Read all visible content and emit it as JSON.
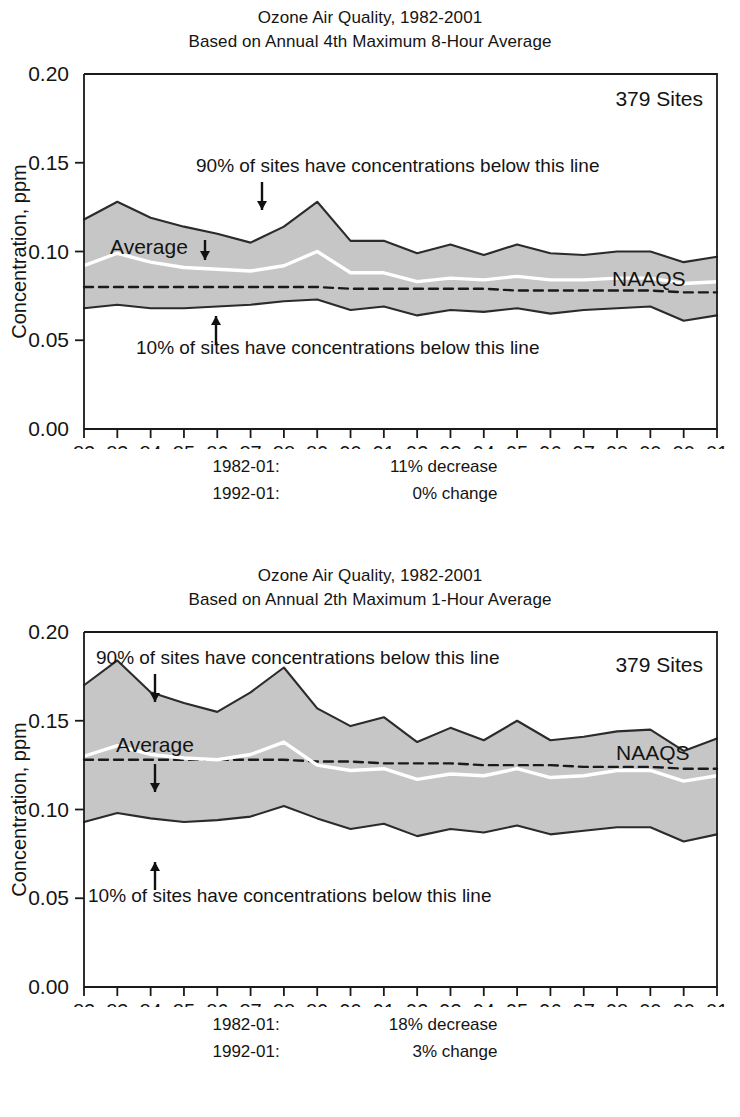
{
  "page": {
    "background": "#ffffff",
    "band_fill": "#c6c6c6",
    "band_edge": "#2b2b2b",
    "average_line_color": "#ffffff",
    "naaqs_line_color": "#1a1a1a"
  },
  "charts": [
    {
      "id": "ozone-8hour",
      "title_line1": "Ozone Air Quality, 1982-2001",
      "title_line2": "Based on Annual 4th Maximum 8-Hour Average",
      "sites_label": "379 Sites",
      "naaqs_label": "NAAQS",
      "average_label": "Average",
      "upper_annotation": "90% of sites have concentrations below this line",
      "lower_annotation": "10% of sites have concentrations below this line",
      "ylabel": "Concentration, ppm",
      "ytick_labels": [
        "0.20",
        "0.15",
        "0.10",
        "0.05",
        "0.00"
      ],
      "ytick_values": [
        0.2,
        0.15,
        0.1,
        0.05,
        0.0
      ],
      "ylim": [
        0.0,
        0.2
      ],
      "xtick_labels": [
        "82",
        "83",
        "84",
        "85",
        "86",
        "87",
        "88",
        "89",
        "90",
        "91",
        "92",
        "93",
        "94",
        "95",
        "96",
        "97",
        "98",
        "00",
        "00",
        "01"
      ],
      "footnotes": [
        {
          "label": "1982-01:",
          "value": "11% decrease"
        },
        {
          "label": "1992-01:",
          "value": "0% change"
        }
      ],
      "chart_data": {
        "type": "area",
        "title": "Ozone Air Quality, 1982-2001 — Based on Annual 4th Maximum 8-Hour Average",
        "xlabel": "",
        "ylabel": "Concentration, ppm",
        "ylim": [
          0.0,
          0.2
        ],
        "grid": false,
        "legend": "inline annotations",
        "categories": [
          "82",
          "83",
          "84",
          "85",
          "86",
          "87",
          "88",
          "89",
          "90",
          "91",
          "92",
          "93",
          "94",
          "95",
          "96",
          "97",
          "98",
          "00",
          "00",
          "01"
        ],
        "series": [
          {
            "name": "90th percentile",
            "values": [
              0.118,
              0.128,
              0.119,
              0.114,
              0.11,
              0.105,
              0.114,
              0.128,
              0.106,
              0.106,
              0.099,
              0.104,
              0.098,
              0.104,
              0.099,
              0.098,
              0.1,
              0.1,
              0.094,
              0.097
            ]
          },
          {
            "name": "Average",
            "values": [
              0.092,
              0.099,
              0.094,
              0.091,
              0.09,
              0.089,
              0.092,
              0.1,
              0.088,
              0.088,
              0.083,
              0.085,
              0.084,
              0.086,
              0.084,
              0.084,
              0.085,
              0.085,
              0.082,
              0.083
            ]
          },
          {
            "name": "10th percentile",
            "values": [
              0.068,
              0.07,
              0.068,
              0.068,
              0.069,
              0.07,
              0.072,
              0.073,
              0.067,
              0.069,
              0.064,
              0.067,
              0.066,
              0.068,
              0.065,
              0.067,
              0.068,
              0.069,
              0.061,
              0.064
            ]
          },
          {
            "name": "NAAQS",
            "values": [
              0.08,
              0.08,
              0.08,
              0.08,
              0.08,
              0.08,
              0.08,
              0.08,
              0.079,
              0.079,
              0.079,
              0.079,
              0.079,
              0.078,
              0.078,
              0.078,
              0.078,
              0.078,
              0.077,
              0.077
            ]
          }
        ]
      }
    },
    {
      "id": "ozone-1hour",
      "title_line1": "Ozone Air Quality, 1982-2001",
      "title_line2": "Based on Annual 2th Maximum 1-Hour Average",
      "sites_label": "379 Sites",
      "naaqs_label": "NAAQS",
      "average_label": "Average",
      "upper_annotation": "90% of sites have concentrations below this line",
      "lower_annotation": "10% of sites have concentrations below this line",
      "ylabel": "Concentration, ppm",
      "ytick_labels": [
        "0.20",
        "0.15",
        "0.10",
        "0.05",
        "0.00"
      ],
      "ytick_values": [
        0.2,
        0.15,
        0.1,
        0.05,
        0.0
      ],
      "ylim": [
        0.0,
        0.2
      ],
      "xtick_labels": [
        "82",
        "83",
        "84",
        "85",
        "86",
        "87",
        "88",
        "89",
        "90",
        "91",
        "92",
        "93",
        "94",
        "95",
        "96",
        "97",
        "98",
        "00",
        "00",
        "01"
      ],
      "footnotes": [
        {
          "label": "1982-01:",
          "value": "18% decrease"
        },
        {
          "label": "1992-01:",
          "value": "3% change"
        }
      ],
      "chart_data": {
        "type": "area",
        "title": "Ozone Air Quality, 1982-2001 — Based on Annual 2th Maximum 1-Hour Average",
        "xlabel": "",
        "ylabel": "Concentration, ppm",
        "ylim": [
          0.0,
          0.2
        ],
        "grid": false,
        "legend": "inline annotations",
        "categories": [
          "82",
          "83",
          "84",
          "85",
          "86",
          "87",
          "88",
          "89",
          "90",
          "91",
          "92",
          "93",
          "94",
          "95",
          "96",
          "97",
          "98",
          "00",
          "00",
          "01"
        ],
        "series": [
          {
            "name": "90th percentile",
            "values": [
              0.17,
              0.184,
              0.166,
              0.16,
              0.155,
              0.166,
              0.18,
              0.157,
              0.147,
              0.152,
              0.138,
              0.146,
              0.139,
              0.15,
              0.139,
              0.141,
              0.144,
              0.145,
              0.133,
              0.14
            ]
          },
          {
            "name": "Average",
            "values": [
              0.13,
              0.136,
              0.131,
              0.129,
              0.128,
              0.131,
              0.138,
              0.125,
              0.122,
              0.123,
              0.117,
              0.12,
              0.119,
              0.123,
              0.118,
              0.119,
              0.122,
              0.122,
              0.116,
              0.119
            ]
          },
          {
            "name": "10th percentile",
            "values": [
              0.093,
              0.098,
              0.095,
              0.093,
              0.094,
              0.096,
              0.102,
              0.095,
              0.089,
              0.092,
              0.085,
              0.089,
              0.087,
              0.091,
              0.086,
              0.088,
              0.09,
              0.09,
              0.082,
              0.086
            ]
          },
          {
            "name": "NAAQS",
            "values": [
              0.128,
              0.128,
              0.128,
              0.128,
              0.128,
              0.128,
              0.128,
              0.127,
              0.127,
              0.126,
              0.126,
              0.126,
              0.125,
              0.125,
              0.125,
              0.124,
              0.124,
              0.124,
              0.123,
              0.123
            ]
          }
        ]
      }
    }
  ]
}
